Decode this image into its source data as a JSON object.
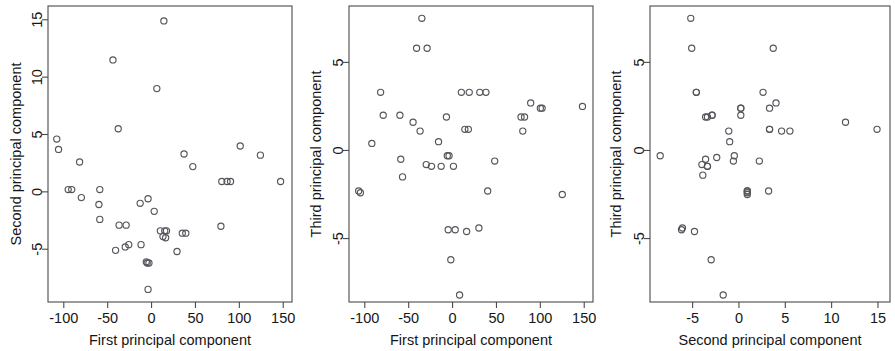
{
  "figure": {
    "panel_count": 3,
    "point_color": "#55555c",
    "axis_color": "#4a4a4a",
    "background": "#ffffff"
  },
  "chart_data": [
    {
      "type": "scatter",
      "title": "",
      "xlabel": "First principal component",
      "ylabel": "Second principal component",
      "xlim": [
        -118,
        160
      ],
      "ylim": [
        -9.6,
        16.2
      ],
      "xticks": [
        -100,
        -50,
        0,
        50,
        100,
        150
      ],
      "yticks": [
        -5,
        0,
        5,
        10,
        15
      ],
      "xtick_labels": [
        "-100",
        "-50",
        "0",
        "50",
        "100",
        "150"
      ],
      "ytick_labels": [
        "-5",
        "0",
        "5",
        "10",
        "15"
      ],
      "grid": false,
      "legend": "none",
      "x": [
        -108,
        -106,
        -95,
        -91,
        -82,
        -80,
        -60,
        -59,
        -59,
        -44,
        -41,
        -38,
        -37,
        -30,
        -29,
        -26,
        -13,
        -12,
        -6,
        -5,
        -4,
        -4,
        -3,
        3,
        6,
        10,
        13,
        14,
        15,
        16,
        17,
        29,
        35,
        37,
        39,
        47,
        79,
        80,
        86,
        90,
        101,
        124,
        147
      ],
      "y": [
        4.6,
        3.7,
        0.2,
        0.2,
        2.6,
        -0.5,
        -1.1,
        0.2,
        -2.4,
        11.5,
        -5.1,
        5.5,
        -2.9,
        -4.8,
        -2.9,
        -4.6,
        -1.0,
        -4.6,
        -6.1,
        -6.2,
        -0.6,
        -8.5,
        -6.2,
        -1.7,
        9.0,
        -3.4,
        -3.9,
        14.9,
        -3.4,
        -4.0,
        -3.4,
        -5.2,
        -3.6,
        3.3,
        -3.6,
        2.2,
        -3.0,
        0.9,
        0.9,
        0.9,
        4.0,
        3.2,
        0.9
      ]
    },
    {
      "type": "scatter",
      "title": "",
      "xlabel": "First principal component",
      "ylabel": "Third principal component",
      "xlim": [
        -118,
        160
      ],
      "ylim": [
        -8.6,
        8.2
      ],
      "xticks": [
        -100,
        -50,
        0,
        50,
        100,
        150
      ],
      "yticks": [
        -5,
        0,
        5
      ],
      "xtick_labels": [
        "-100",
        "-50",
        "0",
        "50",
        "100",
        "150"
      ],
      "ytick_labels": [
        "-5",
        "0",
        "5"
      ],
      "grid": false,
      "legend": "none",
      "x": [
        -107,
        -105,
        -92,
        -82,
        -79,
        -60,
        -59,
        -57,
        -45,
        -41,
        -37,
        -35,
        -30,
        -29,
        -24,
        -16,
        -13,
        -7,
        -6,
        -5,
        -4,
        -2,
        1,
        3,
        8,
        10,
        14,
        16,
        18,
        19,
        30,
        31,
        38,
        40,
        48,
        78,
        80,
        82,
        89,
        100,
        102,
        125,
        148
      ],
      "y": [
        -2.3,
        -2.4,
        0.4,
        3.3,
        2.0,
        2.0,
        -0.5,
        -1.5,
        1.6,
        5.8,
        1.1,
        7.5,
        -0.8,
        5.8,
        -0.9,
        0.5,
        -0.9,
        1.9,
        -0.3,
        -4.5,
        -0.3,
        -6.2,
        -0.9,
        -4.5,
        -8.2,
        3.3,
        1.2,
        -4.6,
        1.2,
        3.3,
        -4.4,
        3.3,
        3.3,
        -2.3,
        -0.6,
        1.9,
        1.1,
        1.9,
        2.7,
        2.4,
        2.4,
        -2.5,
        2.5
      ]
    },
    {
      "type": "scatter",
      "title": "",
      "xlabel": "Second principal component",
      "ylabel": "Third principal component",
      "xlim": [
        -9.6,
        16.3
      ],
      "ylim": [
        -8.6,
        8.2
      ],
      "xticks": [
        -5,
        0,
        5,
        10,
        15
      ],
      "yticks": [
        -5,
        0,
        5
      ],
      "xtick_labels": [
        "-5",
        "0",
        "5",
        "10",
        "15"
      ],
      "ytick_labels": [
        "-5",
        "0",
        "5"
      ],
      "grid": false,
      "legend": "none",
      "x": [
        -8.5,
        -6.2,
        -6.1,
        -5.2,
        -5.1,
        -4.8,
        -4.6,
        -4.6,
        -4.0,
        -3.9,
        -3.6,
        -3.6,
        -3.4,
        -3.4,
        -3.4,
        -3.0,
        -2.9,
        -2.9,
        -2.4,
        -1.7,
        -1.1,
        -1.0,
        -0.6,
        -0.5,
        0.2,
        0.2,
        0.2,
        0.9,
        0.9,
        0.9,
        0.9,
        2.2,
        2.6,
        3.2,
        3.3,
        3.3,
        3.3,
        3.7,
        4.0,
        4.6,
        5.5,
        11.5,
        14.9
      ],
      "y": [
        -0.3,
        -4.5,
        -4.4,
        7.5,
        5.8,
        -4.6,
        3.3,
        3.3,
        -0.8,
        -1.4,
        -0.5,
        1.9,
        1.9,
        -0.9,
        -0.9,
        -6.2,
        2.0,
        2.0,
        -0.4,
        -8.2,
        1.1,
        0.5,
        -0.6,
        -0.3,
        2.4,
        2.4,
        2.0,
        -2.5,
        -2.4,
        -2.3,
        -2.3,
        -0.6,
        3.3,
        -2.3,
        2.4,
        1.2,
        1.2,
        5.8,
        2.7,
        1.1,
        1.1,
        1.6,
        1.2
      ]
    }
  ]
}
